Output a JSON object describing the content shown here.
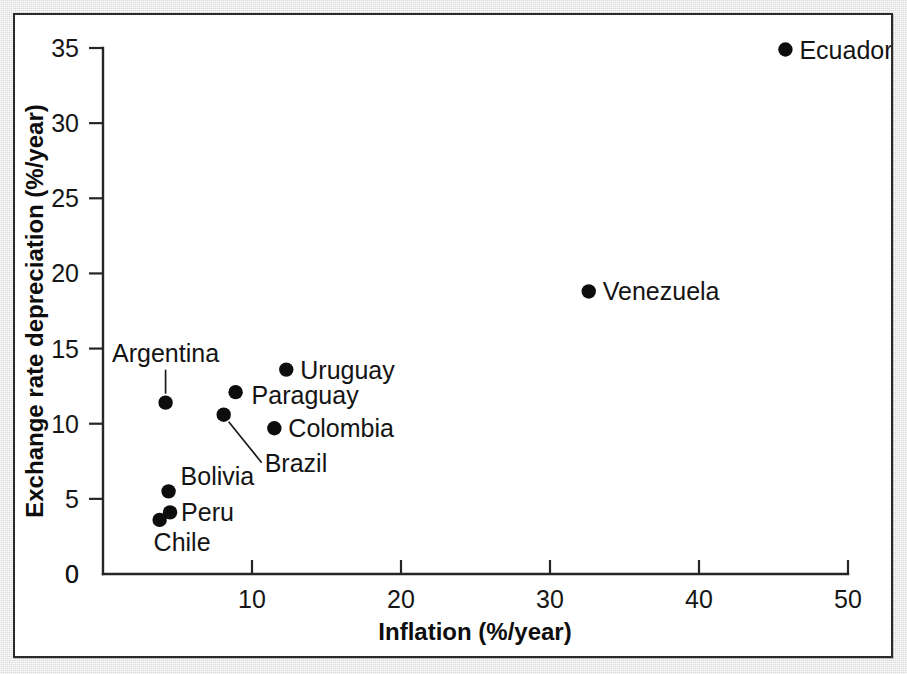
{
  "figure": {
    "background_color": "#ffffff",
    "page_color": "#ebebeb",
    "frame_color": "#2b2b2b",
    "marker_color": "#0d0d0d"
  },
  "chart_data": {
    "type": "scatter",
    "title": "",
    "xlabel": "Inflation (%/year)",
    "ylabel": "Exchange rate depreciation (%/year)",
    "xlim": [
      0,
      50
    ],
    "ylim": [
      0,
      35
    ],
    "xticks": [
      0,
      10,
      20,
      30,
      40,
      50
    ],
    "yticks": [
      0,
      5,
      10,
      15,
      20,
      25,
      30,
      35
    ],
    "xtick_labels": [
      "0",
      "10",
      "20",
      "30",
      "40",
      "50"
    ],
    "ytick_labels": [
      "0",
      "5",
      "10",
      "15",
      "20",
      "25",
      "30",
      "35"
    ],
    "grid": false,
    "legend": "none",
    "points": [
      {
        "label": "Ecuador",
        "x": 45.8,
        "y": 34.9,
        "label_dx": 14,
        "label_dy": 9,
        "label_anchor": "start",
        "leader": false
      },
      {
        "label": "Venezuela",
        "x": 32.6,
        "y": 18.8,
        "label_dx": 14,
        "label_dy": 9,
        "label_anchor": "start",
        "leader": false
      },
      {
        "label": "Uruguay",
        "x": 12.3,
        "y": 13.6,
        "label_dx": 14,
        "label_dy": 9,
        "label_anchor": "start",
        "leader": false
      },
      {
        "label": "Paraguay",
        "x": 8.9,
        "y": 12.1,
        "label_dx": 16,
        "label_dy": 12,
        "label_anchor": "start",
        "leader": false
      },
      {
        "label": "Colombia",
        "x": 11.5,
        "y": 9.7,
        "label_dx": 14,
        "label_dy": 9,
        "label_anchor": "start",
        "leader": false
      },
      {
        "label": "Brazil",
        "x": 8.1,
        "y": 10.6,
        "label_dx": 41,
        "label_dy": 57,
        "label_anchor": "start",
        "leader": true,
        "leader_dx": 38,
        "leader_dy": 48
      },
      {
        "label": "Argentina",
        "x": 4.2,
        "y": 11.4,
        "label_dx": 0,
        "label_dy": -41,
        "label_anchor": "middle",
        "leader": true,
        "leader_dx": 0,
        "leader_dy": -33
      },
      {
        "label": "Bolivia",
        "x": 4.4,
        "y": 5.5,
        "label_dx": 12,
        "label_dy": -6,
        "label_anchor": "start",
        "leader": false
      },
      {
        "label": "Peru",
        "x": 4.5,
        "y": 4.1,
        "label_dx": 11,
        "label_dy": 9,
        "label_anchor": "start",
        "leader": false
      },
      {
        "label": "Chile",
        "x": 3.8,
        "y": 3.6,
        "label_dx": -6,
        "label_dy": 31,
        "label_anchor": "start",
        "leader": false
      }
    ]
  }
}
